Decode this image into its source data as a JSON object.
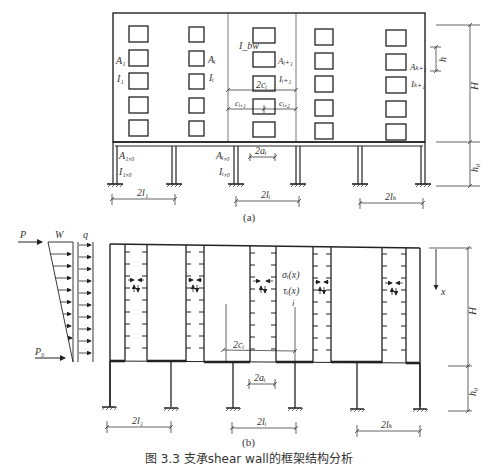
{
  "figure": {
    "caption": "图 3.3  支承shear wall的框架结构分析",
    "subfigure_a_label": "(a)",
    "subfigure_b_label": "(b)"
  },
  "diagram_a": {
    "labels": {
      "A1": "A₁",
      "I1": "I₁",
      "Ai": "Aᵢ",
      "Ii": "Iᵢ",
      "Ibw": "I_bw",
      "Ai1": "Aᵢ₊₁",
      "Ii1": "Iᵢ₊₁",
      "Ak1": "Aₖ₊₁",
      "Ik1": "Iₖ₊₁",
      "two_ci": "2cᵢ",
      "ci1": "cᵢ,₁",
      "ci2": "cᵢ,₂",
      "A10": "A₁,₀",
      "I10": "I₁,₀",
      "Ai0": "Aᵢ,₀",
      "Ii0": "Iᵢ,₀",
      "two_ai": "2aᵢ",
      "two_l1": "2l₁",
      "two_li": "2lᵢ",
      "two_lk": "2lₖ",
      "h": "h",
      "H": "H",
      "h0": "h₀"
    }
  },
  "diagram_b": {
    "labels": {
      "P": "P",
      "W": "W",
      "q": "q",
      "P0": "P₀",
      "sigma": "σᵢ(x)",
      "tau": "τᵢ(x)",
      "i": "i",
      "x": "x",
      "two_ci": "2cᵢ",
      "two_ai": "2aᵢ",
      "two_l1": "2l₁",
      "two_li": "2lᵢ",
      "two_lk": "2lₖ",
      "H": "H",
      "h0": "h₀"
    }
  }
}
